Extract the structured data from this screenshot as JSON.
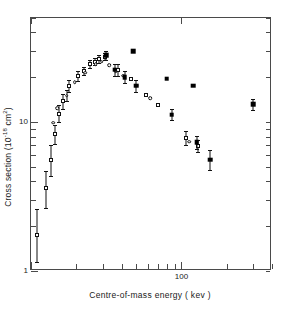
{
  "figure": {
    "axis_titles": {
      "x": "Centre-of-mass energy ( kev )",
      "y_prefix": "Cross section (10",
      "y_exponent": "-18",
      "y_suffix": " cm",
      "y_unit_exponent": "2",
      "y_close": ")"
    }
  },
  "chart_data": {
    "type": "scatter",
    "title": "",
    "xlabel": "Centre-of-mass energy ( kev )",
    "ylabel": "Cross section (10^-18 cm^2)",
    "xscale": "log",
    "yscale": "log",
    "xlim": [
      10,
      400
    ],
    "ylim": [
      1,
      50
    ],
    "xticks": [
      100
    ],
    "xticklabels": [
      "100"
    ],
    "yticks": [
      1,
      10
    ],
    "yticklabels": [
      "1",
      "10"
    ],
    "grid": false,
    "legend": "none",
    "series": [
      {
        "name": "open-squares",
        "marker": "open square",
        "points": [
          {
            "x": 11.0,
            "y": 1.75,
            "yerr_low": 0.6,
            "yerr_high": 0.85
          },
          {
            "x": 12.6,
            "y": 3.6,
            "yerr_low": 0.95,
            "yerr_high": 1.1
          },
          {
            "x": 13.6,
            "y": 5.55,
            "yerr_low": 1.2,
            "yerr_high": 1.45
          },
          {
            "x": 14.4,
            "y": 8.3,
            "yerr_low": 1.2,
            "yerr_high": 1.3
          },
          {
            "x": 15.3,
            "y": 11.4,
            "yerr_low": 1.4,
            "yerr_high": 1.6
          },
          {
            "x": 16.2,
            "y": 13.8,
            "yerr_low": 1.5,
            "yerr_high": 1.7
          },
          {
            "x": 18.0,
            "y": 17.5,
            "yerr_low": 1.6,
            "yerr_high": 1.8
          },
          {
            "x": 20.5,
            "y": 20.5,
            "yerr_low": 1.5,
            "yerr_high": 1.7
          },
          {
            "x": 22.5,
            "y": 22.0,
            "yerr_low": 1.4,
            "yerr_high": 1.6
          },
          {
            "x": 24.5,
            "y": 24.5,
            "yerr_low": 1.5,
            "yerr_high": 1.7
          },
          {
            "x": 26.5,
            "y": 25.5,
            "yerr_low": 1.4,
            "yerr_high": 1.6
          },
          {
            "x": 28.5,
            "y": 26.5,
            "yerr_low": 1.5,
            "yerr_high": 1.7
          },
          {
            "x": 31.0,
            "y": 27.5,
            "yerr_low": 1.5,
            "yerr_high": 1.7
          },
          {
            "x": 38.0,
            "y": 22.5,
            "yerr_low": 2.0,
            "yerr_high": 2.2
          },
          {
            "x": 46.0,
            "y": 19.5,
            "yerr_low": 0.0,
            "yerr_high": 0.0
          },
          {
            "x": 58.0,
            "y": 15.3,
            "yerr_low": 0.0,
            "yerr_high": 0.0
          },
          {
            "x": 70.0,
            "y": 13.0,
            "yerr_low": 0.0,
            "yerr_high": 0.0
          },
          {
            "x": 108.0,
            "y": 7.8,
            "yerr_low": 0.8,
            "yerr_high": 0.9
          },
          {
            "x": 128.0,
            "y": 6.9,
            "yerr_low": 0.6,
            "yerr_high": 0.7
          }
        ]
      },
      {
        "name": "open-circles",
        "marker": "open circle",
        "points": [
          {
            "x": 14.1,
            "y": 9.9,
            "yerr_low": 0.0,
            "yerr_high": 0.0
          },
          {
            "x": 15.0,
            "y": 12.4,
            "yerr_low": 0.0,
            "yerr_high": 0.0
          },
          {
            "x": 17.3,
            "y": 15.0,
            "yerr_low": 1.2,
            "yerr_high": 1.4
          },
          {
            "x": 19.5,
            "y": 18.5,
            "yerr_low": 0.0,
            "yerr_high": 0.0
          },
          {
            "x": 23.0,
            "y": 21.5,
            "yerr_low": 0.0,
            "yerr_high": 0.0
          },
          {
            "x": 27.0,
            "y": 24.5,
            "yerr_low": 0.0,
            "yerr_high": 0.0
          },
          {
            "x": 29.5,
            "y": 25.5,
            "yerr_low": 0.0,
            "yerr_high": 0.0
          },
          {
            "x": 33.0,
            "y": 24.0,
            "yerr_low": 0.0,
            "yerr_high": 0.0
          },
          {
            "x": 36.5,
            "y": 22.0,
            "yerr_low": 0.0,
            "yerr_high": 0.0
          },
          {
            "x": 41.0,
            "y": 20.5,
            "yerr_low": 0.0,
            "yerr_high": 0.0
          },
          {
            "x": 50.0,
            "y": 17.5,
            "yerr_low": 0.0,
            "yerr_high": 0.0
          },
          {
            "x": 62.0,
            "y": 14.5,
            "yerr_low": 0.0,
            "yerr_high": 0.0
          },
          {
            "x": 113.0,
            "y": 7.4,
            "yerr_low": 0.0,
            "yerr_high": 0.0
          }
        ]
      },
      {
        "name": "filled-squares",
        "marker": "filled square",
        "points": [
          {
            "x": 31.5,
            "y": 28.0,
            "yerr_low": 2.0,
            "yerr_high": 2.2
          },
          {
            "x": 36.0,
            "y": 22.5,
            "yerr_low": 2.0,
            "yerr_high": 2.2
          },
          {
            "x": 42.0,
            "y": 20.0,
            "yerr_low": 1.8,
            "yerr_high": 2.0
          },
          {
            "x": 48.0,
            "y": 30.0,
            "yerr_low": 0.0,
            "yerr_high": 0.0
          },
          {
            "x": 50.0,
            "y": 17.5,
            "yerr_low": 1.6,
            "yerr_high": 1.8
          },
          {
            "x": 80.0,
            "y": 19.5,
            "yerr_low": 0.0,
            "yerr_high": 0.0
          },
          {
            "x": 86.0,
            "y": 11.2,
            "yerr_low": 0.9,
            "yerr_high": 1.0
          },
          {
            "x": 120.0,
            "y": 17.5,
            "yerr_low": 0.0,
            "yerr_high": 0.0
          },
          {
            "x": 126.0,
            "y": 7.3,
            "yerr_low": 0.7,
            "yerr_high": 0.8
          },
          {
            "x": 155.0,
            "y": 5.6,
            "yerr_low": 0.8,
            "yerr_high": 0.9
          },
          {
            "x": 300.0,
            "y": 13.2,
            "yerr_low": 1.1,
            "yerr_high": 1.2
          }
        ]
      }
    ]
  }
}
